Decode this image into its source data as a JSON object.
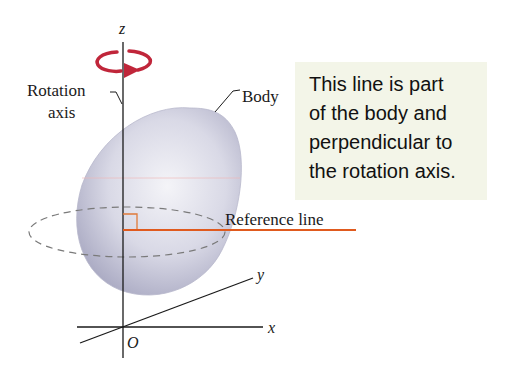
{
  "figure": {
    "axes": {
      "z": "z",
      "y": "y",
      "x": "x",
      "origin": "O"
    },
    "labels": {
      "rotation_axis_line1": "Rotation",
      "rotation_axis_line2": "axis",
      "body": "Body",
      "reference_line": "Reference line"
    },
    "callout": {
      "lines": [
        "This line is part",
        "of the body and",
        "perpendicular to",
        "the rotation axis."
      ]
    },
    "colors": {
      "body_fill": "#c9c9da",
      "rotation_arrow": "#c0263a",
      "reference_line": "#e05a1e",
      "callout_bg": "#f3f5e8",
      "axis": "#1a1a1a",
      "dashed_circle": "#7a7a7a"
    }
  }
}
